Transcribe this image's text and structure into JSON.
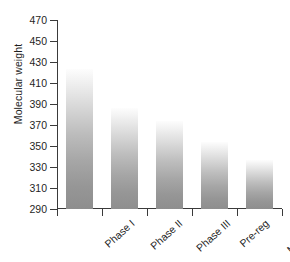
{
  "chart_data": {
    "type": "bar",
    "title": "",
    "subtitle": "",
    "xlabel": "",
    "ylabel": "Molecular weight",
    "categories": [
      "Phase I",
      "Phase II",
      "Phase III",
      "Pre-reg",
      "Marketed"
    ],
    "values": [
      423,
      386,
      374,
      354,
      337
    ],
    "ylim": [
      290,
      470
    ],
    "ytick_labels": [
      "470",
      "450",
      "430",
      "410",
      "390",
      "370",
      "350",
      "330",
      "310",
      "290"
    ],
    "ytick_values": [
      470,
      450,
      430,
      410,
      390,
      370,
      350,
      330,
      310,
      290
    ],
    "ytick_step": 20,
    "grid": false,
    "legend": false,
    "legend_position": "none",
    "series": [
      {
        "name": "Molecular weight",
        "values": [
          423,
          386,
          374,
          354,
          337
        ]
      }
    ],
    "bar_style": {
      "fill": "vertical-gradient",
      "gradient_top": "#fdfdfd",
      "gradient_bottom": "#8e8e8e"
    },
    "axis_color": "#3a3a3a",
    "text_color": "#1f1f1f",
    "background": "#ffffff"
  }
}
